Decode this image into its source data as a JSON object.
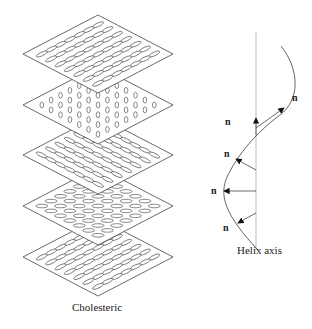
{
  "diagram": {
    "title_label": "Cholesteric",
    "axis_label": "Helix axis",
    "director_symbol": "n",
    "plates": [
      {
        "index": 1,
        "molecule_orientation": "diagonal-left"
      },
      {
        "index": 2,
        "molecule_orientation": "vertical"
      },
      {
        "index": 3,
        "molecule_orientation": "diagonal-right"
      },
      {
        "index": 4,
        "molecule_orientation": "horizontal"
      },
      {
        "index": 5,
        "molecule_orientation": "diagonal-left"
      }
    ],
    "director_labels": [
      "n",
      "n",
      "n",
      "n",
      "n"
    ],
    "colors": {
      "line": "#444444",
      "axis": "#999999"
    }
  }
}
